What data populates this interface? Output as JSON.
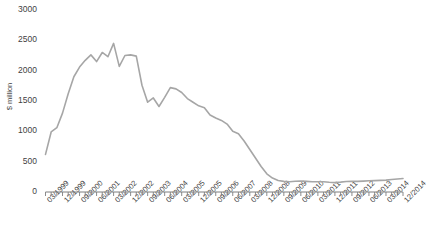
{
  "chart_data": {
    "type": "line",
    "title": "",
    "xlabel": "",
    "ylabel": "$ million",
    "ylim": [
      0,
      3000
    ],
    "yticks": [
      0,
      500,
      1000,
      1500,
      2000,
      2500,
      3000
    ],
    "grid": false,
    "legend": "none",
    "line_color": "#a6a6a6",
    "axis_color": "#7f7f7f",
    "text_color": "#3f3f3f",
    "xtick_labels": [
      "03/1999",
      "12/1999",
      "09/2000",
      "06/2001",
      "03/2002",
      "12/2002",
      "09/2003",
      "06/2004",
      "03/2005",
      "12/2005",
      "09/2006",
      "06/2007",
      "03/2008",
      "12/2008",
      "09/2009",
      "06/2010",
      "03/2011",
      "12/2011",
      "09/2012",
      "06/2013",
      "03/2014",
      "12/2014"
    ],
    "xtick_interval_quarters": 3,
    "x": [
      "03/1999",
      "06/1999",
      "09/1999",
      "12/1999",
      "03/2000",
      "06/2000",
      "09/2000",
      "12/2000",
      "03/2001",
      "06/2001",
      "09/2001",
      "12/2001",
      "03/2002",
      "06/2002",
      "09/2002",
      "12/2002",
      "03/2003",
      "06/2003",
      "09/2003",
      "12/2003",
      "03/2004",
      "06/2004",
      "09/2004",
      "12/2004",
      "03/2005",
      "06/2005",
      "09/2005",
      "12/2005",
      "03/2006",
      "06/2006",
      "09/2006",
      "12/2006",
      "03/2007",
      "06/2007",
      "09/2007",
      "12/2007",
      "03/2008",
      "06/2008",
      "09/2008",
      "12/2008",
      "03/2009",
      "06/2009",
      "09/2009",
      "12/2009",
      "03/2010",
      "06/2010",
      "09/2010",
      "12/2010",
      "03/2011",
      "06/2011",
      "09/2011",
      "12/2011",
      "03/2012",
      "06/2012",
      "09/2012",
      "12/2012",
      "03/2013",
      "06/2013",
      "09/2013",
      "12/2013",
      "03/2014",
      "06/2014",
      "09/2014",
      "12/2014"
    ],
    "values": [
      620,
      990,
      1060,
      1300,
      1620,
      1900,
      2060,
      2170,
      2260,
      2150,
      2300,
      2230,
      2450,
      2070,
      2250,
      2260,
      2240,
      1760,
      1480,
      1550,
      1410,
      1560,
      1720,
      1700,
      1640,
      1540,
      1480,
      1420,
      1390,
      1270,
      1220,
      1180,
      1120,
      1000,
      960,
      840,
      700,
      560,
      420,
      300,
      230,
      190,
      175,
      170,
      178,
      180,
      175,
      168,
      170,
      168,
      160,
      155,
      162,
      172,
      178,
      175,
      180,
      185,
      188,
      192,
      196,
      205,
      215,
      222
    ],
    "series_name": "$ million"
  }
}
